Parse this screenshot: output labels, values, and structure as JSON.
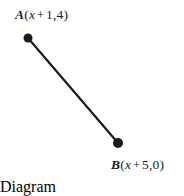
{
  "figure": {
    "type": "geometry-line-segment-diagram",
    "background_color": "#ffffff",
    "stroke_color": "#1a1a1a"
  },
  "points": {
    "a": {
      "name": "A",
      "open_paren": "(",
      "variable": "x",
      "operator": "+",
      "coordinates_text": "1,4",
      "close_paren": ")",
      "full_label": "A (x + 1,4)",
      "x_coord_expression": "x + 1",
      "y_coord_expression": "4",
      "pixel_x": 28,
      "pixel_y": 38,
      "dot_radius": 4.5
    },
    "b": {
      "name": "B",
      "open_paren": "(",
      "variable": "x",
      "operator": "+",
      "coordinates_text": "5,0",
      "close_paren": ")",
      "full_label": "B (x + 5,0)",
      "x_coord_expression": "x + 5",
      "y_coord_expression": "0",
      "pixel_x": 118,
      "pixel_y": 143,
      "dot_radius": 5
    }
  },
  "segment": {
    "name": "AB",
    "x1": 28,
    "y1": 38,
    "x2": 118,
    "y2": 143,
    "stroke_width": 2.2
  }
}
